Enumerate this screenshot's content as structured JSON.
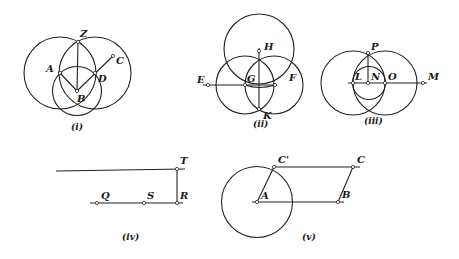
{
  "figures": {
    "i": {
      "caption": "(i)",
      "labels": {
        "Z": "Z",
        "A": "A",
        "B": "B",
        "C": "C",
        "D": "D"
      }
    },
    "ii": {
      "caption": "(ii)",
      "labels": {
        "E": "E",
        "F": "F",
        "G": "G",
        "H": "H",
        "K": "K"
      }
    },
    "iii": {
      "caption": "(iii)",
      "labels": {
        "L": "L",
        "M": "M",
        "N": "N",
        "O": "O",
        "P": "P"
      }
    },
    "iv": {
      "caption": "(iv)",
      "labels": {
        "Q": "Q",
        "R": "R",
        "S": "S",
        "T": "T"
      }
    },
    "v": {
      "caption": "(v)",
      "labels": {
        "A": "A",
        "B": "B",
        "C": "C",
        "Cp": "C'"
      }
    }
  }
}
